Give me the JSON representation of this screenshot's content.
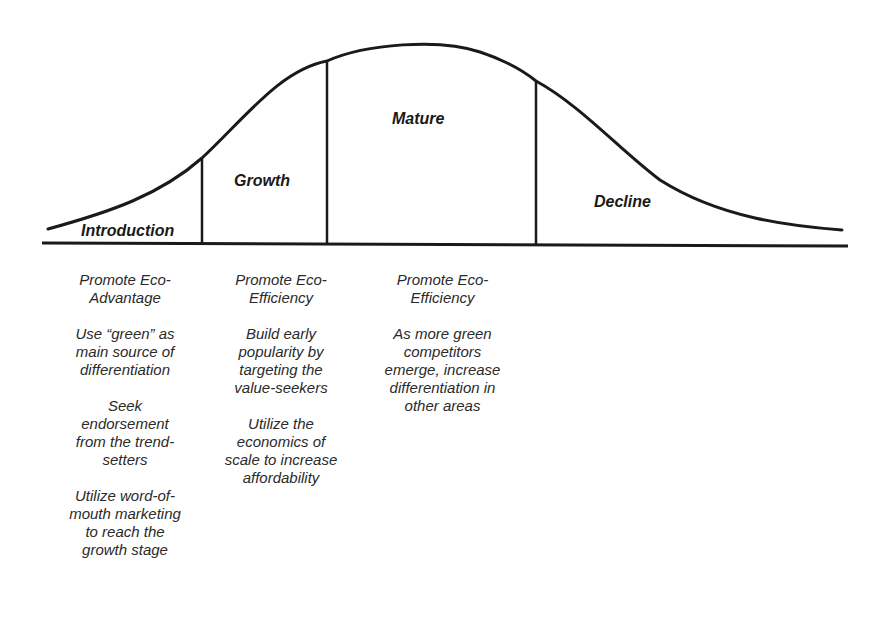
{
  "diagram": {
    "type": "product-life-cycle-curve",
    "stages": [
      {
        "name": "Introduction"
      },
      {
        "name": "Growth"
      },
      {
        "name": "Mature"
      },
      {
        "name": "Decline"
      }
    ],
    "line_color": "#1a1a1a"
  },
  "columns": [
    {
      "stage": "Introduction",
      "items": [
        "Promote Eco-\nAdvantage",
        "Use “green” as\nmain source of\ndifferentiation",
        "Seek\nendorsement\nfrom the trend-\nsetters",
        "Utilize word-of-\nmouth marketing\nto reach the\ngrowth stage"
      ]
    },
    {
      "stage": "Growth",
      "items": [
        "Promote Eco-\nEfficiency",
        "Build early\npopularity by\ntargeting the\nvalue-seekers",
        "Utilize the\neconomics of\nscale to increase\naffordability"
      ]
    },
    {
      "stage": "Mature",
      "items": [
        "Promote Eco-\nEfficiency",
        "As more green\ncompetitors\nemerge, increase\ndifferentiation in\nother areas"
      ]
    }
  ]
}
